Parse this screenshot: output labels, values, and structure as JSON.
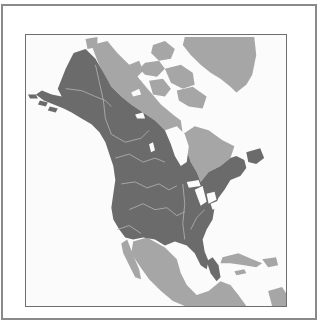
{
  "map": {
    "subject": "North America range map",
    "colors": {
      "background": "#fbfbfb",
      "frame": "#8a8a8a",
      "map_border": "#6e6e6e",
      "primary_range": "#6b6b6b",
      "secondary_range": "#a6a6a6",
      "water_lines": "#b4b4b4",
      "lakes": "#fbfbfb"
    },
    "regions": [
      {
        "name": "primary-range",
        "description": "dark gray: Alaska, Canada (south of tundra), contiguous United States"
      },
      {
        "name": "secondary-range",
        "description": "light gray: Arctic Canada, Greenland, northern Quebec, Mexico, Central America, Caribbean"
      }
    ]
  }
}
